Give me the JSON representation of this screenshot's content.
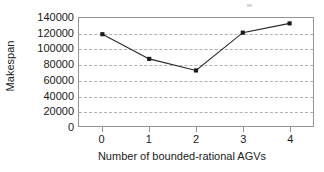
{
  "chart_data": {
    "type": "line",
    "title": "",
    "xlabel": "Number of bounded-rational AGVs",
    "ylabel": "Makespan",
    "categories": [
      "0",
      "1",
      "2",
      "3",
      "4"
    ],
    "x": [
      0,
      1,
      2,
      3,
      4
    ],
    "values": [
      119000,
      87000,
      72000,
      121000,
      133000
    ],
    "series": [
      {
        "name": "Makespan",
        "values": [
          119000,
          87000,
          72000,
          121000,
          133000
        ]
      }
    ],
    "xlim": [
      -0.5,
      4.5
    ],
    "ylim": [
      0,
      140000
    ],
    "ytick_labels": [
      "140000",
      "120000",
      "100000",
      "80000",
      "60000",
      "40000",
      "20000",
      "0"
    ],
    "ytick_values": [
      140000,
      120000,
      100000,
      80000,
      60000,
      40000,
      20000,
      0
    ],
    "xtick_labels": [
      "0",
      "1",
      "2",
      "3",
      "4"
    ],
    "grid": "horizontal-dashed",
    "legend": "none",
    "line_color": "#262626",
    "marker_color": "#1a1a1a",
    "marker_shape": "square",
    "gridline_color": "#b0b0b0",
    "axis_color": "#949494",
    "background_color": "#ffffff",
    "annotations": []
  }
}
